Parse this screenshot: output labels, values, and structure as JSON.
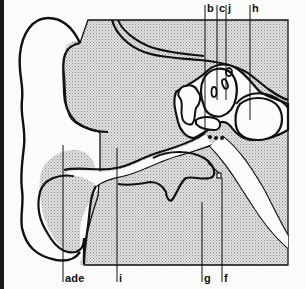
{
  "diagram": {
    "colors": {
      "outline": "#111111",
      "stipple_fill": "#cfcfcf",
      "background": "#fbfbfb"
    },
    "labels_top": [
      {
        "id": "b",
        "text": "b"
      },
      {
        "id": "c",
        "text": "c"
      },
      {
        "id": "j",
        "text": "j"
      },
      {
        "id": "h",
        "text": "h"
      }
    ],
    "labels_bottom": [
      {
        "id": "ade",
        "text": "ade"
      },
      {
        "id": "i",
        "text": "i"
      },
      {
        "id": "g",
        "text": "g"
      },
      {
        "id": "f",
        "text": "f"
      }
    ]
  }
}
